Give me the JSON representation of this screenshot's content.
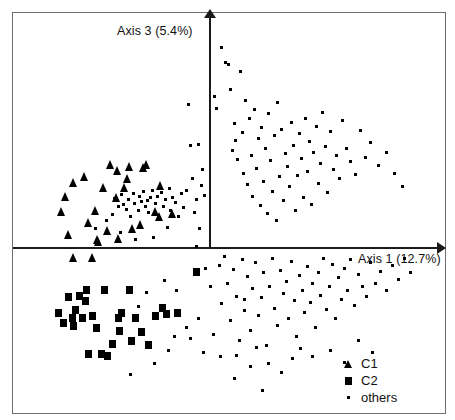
{
  "figure": {
    "width": 455,
    "height": 420,
    "background": "#ffffff",
    "marker_color": "#000000",
    "axis_color": "#1a1a1a",
    "frame_color": "#6e6e6e"
  },
  "axes": {
    "x_label": "Axis 1 (12.7%)",
    "y_label": "Axis 3 (5.4%)",
    "origin_x_px": 210,
    "origin_y_px": 248,
    "x_arrow_name": "right-arrow-icon",
    "y_arrow_name": "up-arrow-icon"
  },
  "legend": {
    "items": [
      {
        "label": "C1",
        "symbol": "triangle"
      },
      {
        "label": "C2",
        "symbol": "square"
      },
      {
        "label": "others",
        "symbol": "dot"
      }
    ]
  },
  "chart_data": {
    "type": "scatter",
    "title": "",
    "xlabel": "Axis 1 (12.7%)",
    "ylabel": "Axis 3 (5.4%)",
    "grid": false,
    "legend_position": "bottom-right",
    "axis_style": "crossed-arrows-at-origin",
    "xlim": [
      -1,
      1
    ],
    "ylim": [
      -1,
      1
    ],
    "note": "Principal coordinates ordination; coordinates below are figure-pixel positions of marker centers within the 455x420 canvas. Origin of the crossed axes is at pixel (210, 248).",
    "series": [
      {
        "name": "C1",
        "symbol": "triangle",
        "count": 28,
        "points_px": [
          [
            68,
            234
          ],
          [
            73,
            257
          ],
          [
            92,
            257
          ],
          [
            97,
            239
          ],
          [
            61,
            211
          ],
          [
            65,
            196
          ],
          [
            73,
            182
          ],
          [
            84,
            176
          ],
          [
            88,
            222
          ],
          [
            95,
            210
          ],
          [
            98,
            241
          ],
          [
            103,
            187
          ],
          [
            107,
            230
          ],
          [
            110,
            164
          ],
          [
            116,
            197
          ],
          [
            117,
            170
          ],
          [
            118,
            238
          ],
          [
            124,
            187
          ],
          [
            127,
            178
          ],
          [
            129,
            166
          ],
          [
            132,
            228
          ],
          [
            140,
            224
          ],
          [
            143,
            167
          ],
          [
            146,
            164
          ],
          [
            155,
            211
          ],
          [
            159,
            216
          ],
          [
            160,
            185
          ],
          [
            172,
            213
          ]
        ]
      },
      {
        "name": "C2",
        "symbol": "square",
        "count": 30,
        "points_px": [
          [
            58,
            313
          ],
          [
            63,
            323
          ],
          [
            68,
            297
          ],
          [
            72,
            318
          ],
          [
            73,
            326
          ],
          [
            75,
            310
          ],
          [
            79,
            296
          ],
          [
            82,
            318
          ],
          [
            85,
            301
          ],
          [
            86,
            290
          ],
          [
            88,
            354
          ],
          [
            92,
            316
          ],
          [
            96,
            328
          ],
          [
            101,
            354
          ],
          [
            104,
            290
          ],
          [
            107,
            356
          ],
          [
            112,
            344
          ],
          [
            118,
            318
          ],
          [
            119,
            331
          ],
          [
            121,
            313
          ],
          [
            129,
            290
          ],
          [
            131,
            341
          ],
          [
            135,
            318
          ],
          [
            141,
            332
          ],
          [
            148,
            345
          ],
          [
            155,
            316
          ],
          [
            162,
            308
          ],
          [
            166,
            314
          ],
          [
            177,
            313
          ],
          [
            196,
            272
          ]
        ]
      },
      {
        "name": "others",
        "symbol": "dot",
        "count": 198,
        "points_px": [
          [
            95,
            228
          ],
          [
            106,
            220
          ],
          [
            112,
            214
          ],
          [
            114,
            198
          ],
          [
            118,
            206
          ],
          [
            120,
            232
          ],
          [
            121,
            194
          ],
          [
            123,
            204
          ],
          [
            126,
            209
          ],
          [
            128,
            199
          ],
          [
            130,
            216
          ],
          [
            133,
            193
          ],
          [
            134,
            203
          ],
          [
            135,
            239
          ],
          [
            138,
            210
          ],
          [
            139,
            196
          ],
          [
            141,
            201
          ],
          [
            143,
            191
          ],
          [
            145,
            206
          ],
          [
            147,
            200
          ],
          [
            148,
            212
          ],
          [
            150,
            197
          ],
          [
            152,
            190
          ],
          [
            153,
            237
          ],
          [
            155,
            203
          ],
          [
            157,
            196
          ],
          [
            158,
            219
          ],
          [
            161,
            192
          ],
          [
            163,
            206
          ],
          [
            165,
            199
          ],
          [
            167,
            227
          ],
          [
            169,
            188
          ],
          [
            170,
            210
          ],
          [
            172,
            197
          ],
          [
            175,
            202
          ],
          [
            178,
            216
          ],
          [
            181,
            193
          ],
          [
            183,
            207
          ],
          [
            186,
            190
          ],
          [
            188,
            104
          ],
          [
            190,
            145
          ],
          [
            192,
            178
          ],
          [
            194,
            212
          ],
          [
            196,
            199
          ],
          [
            196,
            246
          ],
          [
            198,
            144
          ],
          [
            199,
            228
          ],
          [
            201,
            185
          ],
          [
            202,
            169
          ],
          [
            204,
            195
          ],
          [
            214,
            96
          ],
          [
            216,
            108
          ],
          [
            221,
            47
          ],
          [
            225,
            62
          ],
          [
            228,
            64
          ],
          [
            230,
            89
          ],
          [
            232,
            150
          ],
          [
            234,
            123
          ],
          [
            235,
            140
          ],
          [
            237,
            159
          ],
          [
            240,
            71
          ],
          [
            242,
            132
          ],
          [
            243,
            173
          ],
          [
            245,
            100
          ],
          [
            247,
            184
          ],
          [
            249,
            118
          ],
          [
            251,
            155
          ],
          [
            252,
            196
          ],
          [
            254,
            109
          ],
          [
            256,
            168
          ],
          [
            258,
            138
          ],
          [
            260,
            205
          ],
          [
            261,
            127
          ],
          [
            263,
            181
          ],
          [
            265,
            148
          ],
          [
            267,
            213
          ],
          [
            268,
            113
          ],
          [
            270,
            160
          ],
          [
            272,
            191
          ],
          [
            274,
            135
          ],
          [
            276,
            220
          ],
          [
            277,
            102
          ],
          [
            279,
            176
          ],
          [
            281,
            129
          ],
          [
            283,
            200
          ],
          [
            285,
            153
          ],
          [
            287,
            166
          ],
          [
            289,
            186
          ],
          [
            291,
            122
          ],
          [
            293,
            145
          ],
          [
            295,
            210
          ],
          [
            297,
            175
          ],
          [
            299,
            133
          ],
          [
            301,
            158
          ],
          [
            303,
            197
          ],
          [
            305,
            118
          ],
          [
            307,
            171
          ],
          [
            309,
            141
          ],
          [
            311,
            204
          ],
          [
            313,
            152
          ],
          [
            316,
            126
          ],
          [
            318,
            183
          ],
          [
            320,
            163
          ],
          [
            322,
            112
          ],
          [
            325,
            146
          ],
          [
            327,
            192
          ],
          [
            330,
            131
          ],
          [
            333,
            169
          ],
          [
            336,
            155
          ],
          [
            339,
            178
          ],
          [
            342,
            120
          ],
          [
            346,
            148
          ],
          [
            350,
            161
          ],
          [
            355,
            174
          ],
          [
            360,
            130
          ],
          [
            365,
            157
          ],
          [
            370,
            142
          ],
          [
            378,
            165
          ],
          [
            386,
            152
          ],
          [
            394,
            173
          ],
          [
            402,
            186
          ],
          [
            219,
            265
          ],
          [
            221,
            303
          ],
          [
            224,
            256
          ],
          [
            227,
            283
          ],
          [
            230,
            320
          ],
          [
            233,
            269
          ],
          [
            236,
            296
          ],
          [
            239,
            340
          ],
          [
            242,
            259
          ],
          [
            244,
            310
          ],
          [
            247,
            276
          ],
          [
            250,
            330
          ],
          [
            252,
            288
          ],
          [
            255,
            262
          ],
          [
            258,
            315
          ],
          [
            261,
            297
          ],
          [
            263,
            272
          ],
          [
            266,
            345
          ],
          [
            269,
            286
          ],
          [
            272,
            258
          ],
          [
            274,
            308
          ],
          [
            277,
            325
          ],
          [
            280,
            270
          ],
          [
            283,
            293
          ],
          [
            286,
            281
          ],
          [
            288,
            318
          ],
          [
            291,
            261
          ],
          [
            294,
            300
          ],
          [
            296,
            336
          ],
          [
            299,
            275
          ],
          [
            302,
            290
          ],
          [
            304,
            312
          ],
          [
            307,
            266
          ],
          [
            310,
            302
          ],
          [
            312,
            283
          ],
          [
            315,
            327
          ],
          [
            318,
            272
          ],
          [
            320,
            295
          ],
          [
            323,
            258
          ],
          [
            326,
            309
          ],
          [
            329,
            286
          ],
          [
            332,
            264
          ],
          [
            335,
            318
          ],
          [
            338,
            277
          ],
          [
            341,
            299
          ],
          [
            344,
            268
          ],
          [
            347,
            290
          ],
          [
            350,
            259
          ],
          [
            354,
            305
          ],
          [
            358,
            274
          ],
          [
            362,
            286
          ],
          [
            366,
            296
          ],
          [
            370,
            262
          ],
          [
            375,
            283
          ],
          [
            380,
            271
          ],
          [
            386,
            290
          ],
          [
            392,
            265
          ],
          [
            398,
            279
          ],
          [
            404,
            258
          ],
          [
            410,
            272
          ],
          [
            234,
            378
          ],
          [
            250,
            366
          ],
          [
            262,
            390
          ],
          [
            281,
            372
          ],
          [
            203,
            352
          ],
          [
            190,
            338
          ],
          [
            176,
            290
          ],
          [
            168,
            350
          ],
          [
            154,
            363
          ],
          [
            146,
            292
          ],
          [
            138,
            306
          ],
          [
            130,
            374
          ],
          [
            198,
            318
          ],
          [
            186,
            327
          ],
          [
            174,
            336
          ],
          [
            164,
            280
          ],
          [
            210,
            286
          ],
          [
            205,
            268
          ],
          [
            213,
            334
          ],
          [
            220,
            356
          ],
          [
            236,
            355
          ],
          [
            244,
            299
          ],
          [
            256,
            347
          ],
          [
            268,
            363
          ],
          [
            292,
            358
          ],
          [
            300,
            348
          ],
          [
            312,
            356
          ],
          [
            330,
            350
          ],
          [
            344,
            362
          ],
          [
            358,
            340
          ],
          [
            372,
            352
          ]
        ]
      }
    ]
  }
}
